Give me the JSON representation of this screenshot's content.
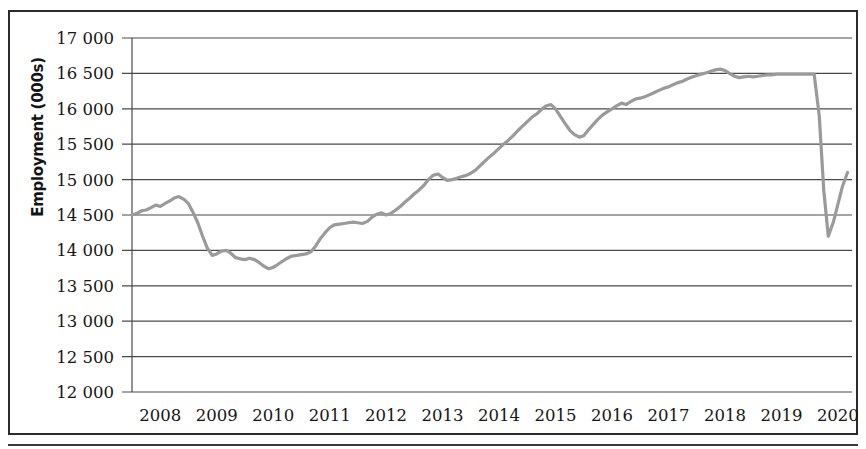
{
  "figure": {
    "ylabel": "Employment (000s)",
    "border_color": "#2b2b2b",
    "line_color": "#9a9a9a",
    "grid_color": "#4a4a4a",
    "background": "#ffffff"
  },
  "chart_data": {
    "type": "line",
    "title": "",
    "subtitle": "",
    "xlabel": "",
    "ylabel": "Employment (000s)",
    "ylim": [
      12000,
      17000
    ],
    "ytick_step": 500,
    "ytick_labels": [
      "17 000",
      "16 500",
      "16 000",
      "15 500",
      "15 000",
      "14 500",
      "14 000",
      "13 500",
      "13 000",
      "12 500",
      "12 000"
    ],
    "ytick_values": [
      17000,
      16500,
      16000,
      15500,
      15000,
      14500,
      14000,
      13500,
      13000,
      12500,
      12000
    ],
    "xtick_labels": [
      "2008",
      "2009",
      "2010",
      "2011",
      "2012",
      "2013",
      "2014",
      "2015",
      "2016",
      "2017",
      "2018",
      "2019",
      "2020"
    ],
    "xtick_values": [
      2008,
      2009,
      2010,
      2011,
      2012,
      2013,
      2014,
      2015,
      2016,
      2017,
      2018,
      2019,
      2020
    ],
    "xlim": [
      2008.0,
      2020.75
    ],
    "grid": true,
    "grid_axis": "y",
    "legend": false,
    "legend_position": "none",
    "annotations": [],
    "series": [
      {
        "name": "Employment",
        "color": "#9a9a9a",
        "x": [
          2008.0,
          2008.08,
          2008.17,
          2008.25,
          2008.33,
          2008.42,
          2008.5,
          2008.58,
          2008.67,
          2008.75,
          2008.83,
          2008.92,
          2009.0,
          2009.08,
          2009.17,
          2009.25,
          2009.33,
          2009.42,
          2009.5,
          2009.58,
          2009.67,
          2009.75,
          2009.83,
          2009.92,
          2010.0,
          2010.08,
          2010.17,
          2010.25,
          2010.33,
          2010.42,
          2010.5,
          2010.58,
          2010.67,
          2010.75,
          2010.83,
          2010.92,
          2011.0,
          2011.08,
          2011.17,
          2011.25,
          2011.33,
          2011.42,
          2011.5,
          2011.58,
          2011.67,
          2011.75,
          2011.83,
          2011.92,
          2012.0,
          2012.08,
          2012.17,
          2012.25,
          2012.33,
          2012.42,
          2012.5,
          2012.58,
          2012.67,
          2012.75,
          2012.83,
          2012.92,
          2013.0,
          2013.08,
          2013.17,
          2013.25,
          2013.33,
          2013.42,
          2013.5,
          2013.58,
          2013.67,
          2013.75,
          2013.83,
          2013.92,
          2014.0,
          2014.08,
          2014.17,
          2014.25,
          2014.33,
          2014.42,
          2014.5,
          2014.58,
          2014.67,
          2014.75,
          2014.83,
          2014.92,
          2015.0,
          2015.08,
          2015.17,
          2015.25,
          2015.33,
          2015.42,
          2015.5,
          2015.58,
          2015.67,
          2015.75,
          2015.83,
          2015.92,
          2016.0,
          2016.08,
          2016.17,
          2016.25,
          2016.33,
          2016.42,
          2016.5,
          2016.58,
          2016.67,
          2016.75,
          2016.83,
          2016.92,
          2017.0,
          2017.08,
          2017.17,
          2017.25,
          2017.33,
          2017.42,
          2017.5,
          2017.58,
          2017.67,
          2017.75,
          2017.83,
          2017.92,
          2018.0,
          2018.08,
          2018.17,
          2018.25,
          2018.33,
          2018.42,
          2018.5,
          2018.58,
          2018.67,
          2018.75,
          2018.83,
          2018.92,
          2019.0,
          2019.08,
          2019.17,
          2019.25,
          2019.33,
          2019.42,
          2019.5,
          2019.58,
          2019.67,
          2019.75,
          2019.83,
          2019.92,
          2020.0,
          2020.08,
          2020.17,
          2020.25,
          2020.33,
          2020.42,
          2020.5,
          2020.58,
          2020.67
        ],
        "values": [
          14500,
          14520,
          14560,
          14570,
          14600,
          14640,
          14620,
          14660,
          14700,
          14740,
          14760,
          14720,
          14660,
          14540,
          14380,
          14200,
          14040,
          13930,
          13950,
          13990,
          14000,
          13960,
          13900,
          13880,
          13870,
          13890,
          13870,
          13830,
          13780,
          13740,
          13760,
          13800,
          13850,
          13890,
          13920,
          13930,
          13940,
          13950,
          13980,
          14060,
          14160,
          14250,
          14320,
          14360,
          14370,
          14380,
          14390,
          14400,
          14390,
          14380,
          14410,
          14470,
          14510,
          14530,
          14500,
          14520,
          14570,
          14620,
          14680,
          14740,
          14800,
          14850,
          14920,
          15000,
          15060,
          15080,
          15030,
          14990,
          15000,
          15020,
          15040,
          15060,
          15090,
          15130,
          15200,
          15260,
          15320,
          15380,
          15440,
          15500,
          15560,
          15620,
          15690,
          15760,
          15820,
          15880,
          15930,
          15990,
          16040,
          16060,
          16000,
          15900,
          15790,
          15700,
          15640,
          15600,
          15620,
          15700,
          15780,
          15850,
          15910,
          15960,
          16000,
          16040,
          16080,
          16060,
          16100,
          16140,
          16150,
          16170,
          16200,
          16230,
          16260,
          16290,
          16310,
          16340,
          16370,
          16390,
          16420,
          16450,
          16470,
          16490,
          16510,
          16530,
          16550,
          16560,
          16540,
          16500,
          16460,
          16440,
          16450,
          16460,
          16450,
          16460,
          16470,
          16480,
          16480,
          16490,
          16490,
          16490,
          16490,
          16490,
          16490,
          16490,
          16490,
          16490,
          15900,
          14850,
          14200,
          14400,
          14650,
          14900,
          15100
        ]
      }
    ]
  }
}
